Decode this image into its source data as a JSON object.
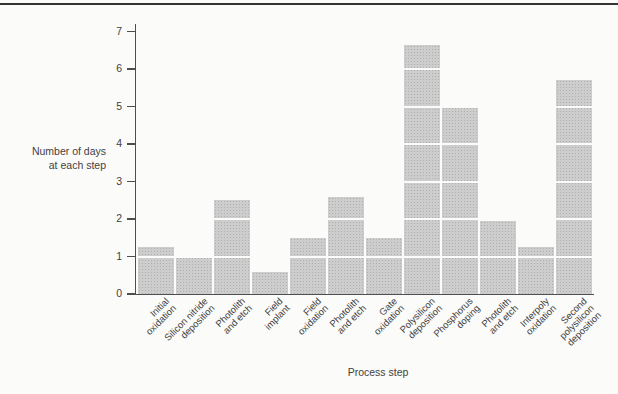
{
  "figure": {
    "background": "#fbfbfa",
    "rule_color": "#343434",
    "bar_color": "#cdcdcd",
    "bar_dot_color": "#aeaeae",
    "axis_color": "#4f4f4f",
    "text_color": "#3f3f3f"
  },
  "chart": {
    "ylabel_line1": "Number of days",
    "ylabel_line2": "at each step",
    "xlabel": "Process step",
    "yticks": [
      0,
      1,
      2,
      3,
      4,
      5,
      6,
      7
    ],
    "categories": [
      {
        "lines": [
          "Initial",
          "oxidation"
        ]
      },
      {
        "lines": [
          "Silicon nitride",
          "deposition"
        ]
      },
      {
        "lines": [
          "Photolith",
          "and etch"
        ]
      },
      {
        "lines": [
          "Field",
          "implant"
        ]
      },
      {
        "lines": [
          "Field",
          "oxidation"
        ]
      },
      {
        "lines": [
          "Photolith",
          "and etch"
        ]
      },
      {
        "lines": [
          "Gate",
          "oxidation"
        ]
      },
      {
        "lines": [
          "Polysilicon",
          "deposition"
        ]
      },
      {
        "lines": [
          "Phosphorus",
          "doping"
        ]
      },
      {
        "lines": [
          "Photolith",
          "and etch"
        ]
      },
      {
        "lines": [
          "Interpoly",
          "oxidation"
        ]
      },
      {
        "lines": [
          "Second",
          "polysilicon",
          "deposition"
        ]
      }
    ],
    "values": [
      1.25,
      1.0,
      2.5,
      0.6,
      1.5,
      2.6,
      1.5,
      6.65,
      5.0,
      1.95,
      1.25,
      5.7
    ]
  },
  "chart_data": {
    "type": "bar",
    "title": "",
    "categories": [
      "Initial oxidation",
      "Silicon nitride deposition",
      "Photolith and etch",
      "Field implant",
      "Field oxidation",
      "Photolith and etch",
      "Gate oxidation",
      "Polysilicon deposition",
      "Phosphorus doping",
      "Photolith and etch",
      "Interpoly oxidation",
      "Second polysilicon deposition"
    ],
    "values": [
      1.25,
      1.0,
      2.5,
      0.6,
      1.5,
      2.6,
      1.5,
      6.65,
      5.0,
      1.95,
      1.25,
      5.7
    ],
    "xlabel": "Process step",
    "ylabel": "Number of days at each step",
    "ylim": [
      0,
      7
    ],
    "yticks": [
      0,
      1,
      2,
      3,
      4,
      5,
      6,
      7
    ],
    "grid": false,
    "legend": false,
    "bar_style": "light gray halftone stipple bars, adjacent with thin white gaps, white horizontal lines crossing bars at each integer value"
  }
}
